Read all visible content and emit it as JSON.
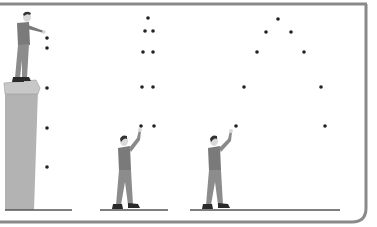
{
  "figure": {
    "colors": {
      "border": "#808080",
      "cliff": "#b3b3b3",
      "cliff_top": "#c8c8c8",
      "ground": "#555555",
      "ball": "#222222",
      "shirt": "#7a7a7a",
      "pants": "#8c8c8c",
      "skin": "#d9d9d9",
      "hair": "#333333",
      "shoes": "#2a2a2a"
    },
    "panels": [
      {
        "name": "dropped-from-cliff",
        "balls": [
          [
            47,
            38
          ],
          [
            47,
            48
          ],
          [
            47,
            88
          ],
          [
            47,
            128
          ],
          [
            47,
            167
          ]
        ]
      },
      {
        "name": "thrown-straight-up",
        "balls": [
          [
            148,
            18
          ],
          [
            145,
            31
          ],
          [
            153,
            31
          ],
          [
            143,
            52
          ],
          [
            153,
            52
          ],
          [
            142,
            87
          ],
          [
            153,
            87
          ],
          [
            141,
            126
          ],
          [
            154,
            126
          ]
        ]
      },
      {
        "name": "thrown-at-angle",
        "balls": [
          [
            278,
            19
          ],
          [
            266,
            32
          ],
          [
            291,
            32
          ],
          [
            257,
            52
          ],
          [
            304,
            52
          ],
          [
            244,
            87
          ],
          [
            321,
            87
          ],
          [
            236,
            126
          ],
          [
            325,
            126
          ]
        ]
      }
    ]
  }
}
